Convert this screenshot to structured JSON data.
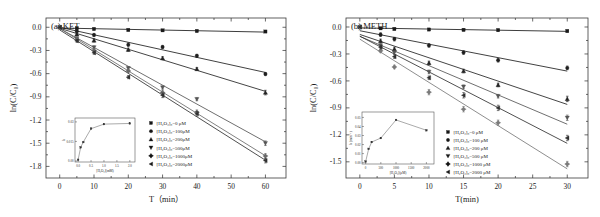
{
  "figure": {
    "background": "#ffffff",
    "panel_count": 2
  },
  "chart_data": [
    {
      "type": "scatter",
      "panel": "a",
      "title": "(a) KET",
      "xlabel": "T（min）",
      "ylabel": "ln(C/C0)",
      "xlim": [
        -4,
        66
      ],
      "ylim": [
        -1.95,
        0.12
      ],
      "xticks": [
        0,
        10,
        20,
        30,
        40,
        50,
        60
      ],
      "yticks": [
        0.0,
        -0.3,
        -0.6,
        -0.9,
        -1.2,
        -1.5,
        -1.8
      ],
      "xticklabels": [
        "0",
        "10",
        "20",
        "30",
        "40",
        "50",
        "60"
      ],
      "yticklabels": [
        "0.0",
        "-0.3",
        "-0.6",
        "-0.9",
        "-1.2",
        "-1.5",
        "-1.8"
      ],
      "grid": false,
      "legend_position": "lower right",
      "x": [
        0,
        5,
        10,
        20,
        30,
        40,
        60
      ],
      "series": [
        {
          "name": "[H2O2]0=0 µM",
          "marker": "square",
          "color": "#1a1a1a",
          "values": [
            0.0,
            -0.012,
            -0.022,
            -0.035,
            -0.04,
            -0.048,
            -0.055
          ],
          "err": [
            0,
            0.012,
            0.012,
            0.012,
            0.012,
            0.012,
            0.012
          ]
        },
        {
          "name": "[H2O2]0=100µM",
          "marker": "circle",
          "color": "#1f1f1f",
          "values": [
            0.0,
            -0.05,
            -0.1,
            -0.225,
            -0.255,
            -0.37,
            -0.605
          ],
          "err": [
            0,
            0.02,
            0.02,
            0.02,
            0.02,
            0.02,
            0.02
          ]
        },
        {
          "name": "[H2O2]0=200µM",
          "marker": "triangle-up",
          "color": "#242424",
          "values": [
            0.0,
            -0.09,
            -0.17,
            -0.29,
            -0.4,
            -0.54,
            -0.845
          ],
          "err": [
            0,
            0.02,
            0.02,
            0.02,
            0.02,
            0.02,
            0.03
          ]
        },
        {
          "name": "[H2O2]0=500µM",
          "marker": "triangle-down",
          "color": "#555555",
          "values": [
            0.0,
            -0.145,
            -0.26,
            -0.53,
            -0.78,
            -0.93,
            -1.5
          ],
          "err": [
            0,
            0.02,
            0.02,
            0.02,
            0.02,
            0.02,
            0.03
          ]
        },
        {
          "name": "[H2O2]0=1000µM",
          "marker": "diamond-plus",
          "color": "#6a6a6a",
          "values": [
            0.0,
            -0.16,
            -0.3,
            -0.565,
            -0.845,
            -1.1,
            -1.665
          ],
          "err": [
            0,
            0.02,
            0.02,
            0.02,
            0.03,
            0.03,
            0.03
          ]
        },
        {
          "name": "[H2O2]0=2000µM",
          "marker": "triangle-left",
          "color": "#303030",
          "values": [
            0.0,
            -0.175,
            -0.33,
            -0.645,
            -0.88,
            -1.12,
            -1.725
          ],
          "err": [
            0,
            0.02,
            0.02,
            0.02,
            0.03,
            0.03,
            0.03
          ]
        }
      ],
      "inset": {
        "xlabel": "[H2O2](mM)",
        "ylabel": "k",
        "xlim": [
          -0.12,
          2.2
        ],
        "ylim": [
          -0.0008,
          0.033
        ],
        "xticks": [
          0.0,
          0.5,
          1.0,
          1.5,
          2.0
        ],
        "xticklabels": [
          "0.0",
          "0.5",
          "1.0",
          "1.5",
          "2.0"
        ],
        "yticks": [
          0.0,
          0.015,
          0.03
        ],
        "yticklabels": [
          "0.00",
          "0.015",
          "0.03"
        ],
        "x": [
          0.0,
          0.1,
          0.2,
          0.5,
          1.0,
          2.0
        ],
        "y": [
          0.0009,
          0.0105,
          0.0145,
          0.0248,
          0.0283,
          0.0288
        ]
      }
    },
    {
      "type": "scatter",
      "panel": "b",
      "title": "(b) METH",
      "xlabel": "T(min)",
      "ylabel": "ln(C/C0)",
      "xlim": [
        -2,
        33
      ],
      "ylim": [
        -1.68,
        0.1
      ],
      "xticks": [
        0,
        5,
        10,
        15,
        20,
        25,
        30
      ],
      "yticks": [
        0.0,
        -0.3,
        -0.6,
        -0.9,
        -1.2,
        -1.5
      ],
      "xticklabels": [
        "0",
        "5",
        "10",
        "15",
        "20",
        "25",
        "30"
      ],
      "yticklabels": [
        "0.0",
        "-0.3",
        "-0.6",
        "-0.9",
        "-1.2",
        "-1.5"
      ],
      "grid": false,
      "legend_position": "lower right",
      "x": [
        0,
        3,
        5,
        10,
        15,
        20,
        30
      ],
      "series": [
        {
          "name": "[H2O2]0=0 µM",
          "marker": "square",
          "color": "#1a1a1a",
          "values": [
            0.0,
            -0.015,
            -0.022,
            -0.028,
            -0.032,
            -0.035,
            -0.045
          ],
          "err": [
            0,
            0.012,
            0.012,
            0.012,
            0.012,
            0.012,
            0.012
          ]
        },
        {
          "name": "[H2O2]0=100 µM",
          "marker": "circle",
          "color": "#1f1f1f",
          "values": [
            0.0,
            -0.085,
            -0.135,
            -0.205,
            -0.285,
            -0.37,
            -0.455
          ],
          "err": [
            0,
            0.02,
            0.02,
            0.02,
            0.02,
            0.02,
            0.02
          ]
        },
        {
          "name": "[H2O2]0=200 µM",
          "marker": "triangle-up",
          "color": "#242424",
          "values": [
            0.0,
            -0.155,
            -0.245,
            -0.4,
            -0.49,
            -0.645,
            -0.8
          ],
          "err": [
            0,
            0.02,
            0.02,
            0.02,
            0.02,
            0.02,
            0.03
          ]
        },
        {
          "name": "[H2O2]0=500 µM",
          "marker": "triangle-down",
          "color": "#555555",
          "values": [
            0.0,
            -0.205,
            -0.285,
            -0.5,
            -0.665,
            -0.77,
            -1.01
          ],
          "err": [
            0,
            0.02,
            0.02,
            0.02,
            0.02,
            0.02,
            0.03
          ]
        },
        {
          "name": "[H2O2]0=1000 µM",
          "marker": "diamond-plus",
          "color": "#7a7a7a",
          "values": [
            0.0,
            -0.265,
            -0.445,
            -0.725,
            -0.915,
            -1.065,
            -1.525
          ],
          "err": [
            0,
            0.02,
            0.02,
            0.03,
            0.03,
            0.03,
            0.03
          ]
        },
        {
          "name": "[H2O2]0=2000 µM",
          "marker": "triangle-left",
          "color": "#303030",
          "values": [
            0.0,
            -0.225,
            -0.33,
            -0.565,
            -0.76,
            -0.9,
            -1.235
          ],
          "err": [
            0,
            0.02,
            0.02,
            0.02,
            0.03,
            0.03,
            0.03
          ]
        }
      ],
      "inset": {
        "xlabel": "[H2O2](µM)",
        "ylabel": "k (min-1)",
        "xlim": [
          -120,
          2250
        ],
        "ylim": [
          -0.0015,
          0.056
        ],
        "xticks": [
          0,
          500,
          1000,
          1500,
          2000
        ],
        "xticklabels": [
          "0",
          "500",
          "1000",
          "1500",
          "2000"
        ],
        "yticks": [
          0.0,
          0.01,
          0.02,
          0.03,
          0.04,
          0.05
        ],
        "yticklabels": [
          "0.00",
          "0.01",
          "0.02",
          "0.03",
          "0.04",
          "0.05"
        ],
        "x": [
          0,
          100,
          200,
          500,
          1000,
          2000
        ],
        "y": [
          0.0012,
          0.0152,
          0.0228,
          0.0272,
          0.0472,
          0.0358
        ]
      }
    }
  ],
  "legend_items": [
    {
      "id": "s0",
      "marker": "square",
      "label_a": "[H₂O₂]₀=0 μM",
      "label_b": "[H₂O₂]₀=0 μM"
    },
    {
      "id": "s1",
      "marker": "circle",
      "label_a": "[H₂O₂]₀=100μM",
      "label_b": "[H₂O₂]₀=100 μM"
    },
    {
      "id": "s2",
      "marker": "triangle-up",
      "label_a": "[H₂O₂]₀=200μM",
      "label_b": "[H₂O₂]₀=200 μM"
    },
    {
      "id": "s3",
      "marker": "triangle-down",
      "label_a": "[H₂O₂]₀=500μM",
      "label_b": "[H₂O₂]₀=500 μM"
    },
    {
      "id": "s4",
      "marker": "diamond-plus",
      "label_a": "[H₂O₂]₀=1000μM",
      "label_b": "[H₂O₂]₀=1000 μM"
    },
    {
      "id": "s5",
      "marker": "triangle-left",
      "label_a": "[H₂O₂]₀=2000μM",
      "label_b": "[H₂O₂]₀=2000 μM"
    }
  ],
  "panel_a": {
    "label": "(a) KET",
    "ylabel": "ln(C/C₀)",
    "xlabel": "T（min）",
    "inset_xlabel": "[H₂O₂](mM)",
    "inset_ylabel": "k"
  },
  "panel_b": {
    "label": "(b) METH",
    "ylabel": "ln(C/C₀)",
    "xlabel": "T(min)",
    "inset_xlabel": "[H₂O₂](μM)",
    "inset_ylabel": "k (min⁻¹)"
  }
}
